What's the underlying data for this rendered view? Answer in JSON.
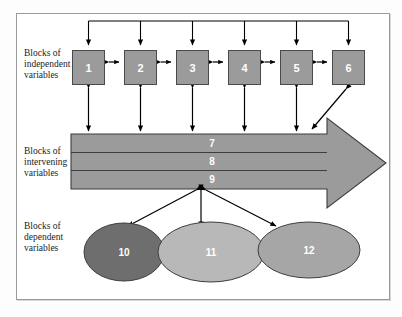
{
  "diagram": {
    "title_visible": false,
    "row_labels": {
      "independent": "Blocks of independent variables",
      "intervening": "Blocks of intervening variables",
      "dependent": "Blocks of dependent variables"
    },
    "independent_boxes": [
      {
        "id": "1",
        "label": "1"
      },
      {
        "id": "2",
        "label": "2"
      },
      {
        "id": "3",
        "label": "3"
      },
      {
        "id": "4",
        "label": "4"
      },
      {
        "id": "5",
        "label": "5"
      },
      {
        "id": "6",
        "label": "6"
      }
    ],
    "intervening_bands": [
      {
        "id": "7",
        "label": "7"
      },
      {
        "id": "8",
        "label": "8"
      },
      {
        "id": "9",
        "label": "9"
      }
    ],
    "dependent_ellipses": [
      {
        "id": "10",
        "label": "10",
        "fill": "#6e6e6e"
      },
      {
        "id": "11",
        "label": "11",
        "fill": "#b8b8b8"
      },
      {
        "id": "12",
        "label": "12",
        "fill": "#a6a6a6"
      }
    ],
    "colors": {
      "box_fill": "#9b9b9b",
      "box_stroke": "#4a4a4a",
      "arrow_fill": "#9b9b9b",
      "arrow_stroke": "#3d3d3d",
      "connector": "#000000",
      "frame_border": "#9a9a9a",
      "text_dark": "#1c1c1c",
      "text_light": "#ffffff"
    }
  }
}
